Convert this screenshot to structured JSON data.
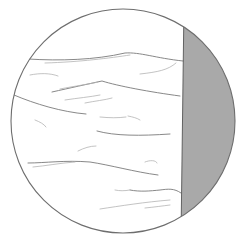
{
  "diagram": {
    "canvas": {
      "width": 242,
      "height": 240,
      "background": "#ffffff"
    },
    "circle": {
      "cx": 123,
      "cy": 121,
      "r": 112,
      "stroke": "#6e6e6e",
      "stroke_width": 1.1,
      "fill": "#ffffff"
    },
    "shaded_region": {
      "fill": "#a9a9a9",
      "boundary_line": {
        "x_top": 184,
        "y_top": 26,
        "x_bottom": 181,
        "y_bottom": 216,
        "stroke": "#555555"
      }
    },
    "line_color": "#7a7a7a",
    "light_line_color": "#b4b4b4",
    "strokes": [
      {
        "d": "M28,59 C60,61 95,60 125,53 C140,52 155,58 183,61",
        "strong": true
      },
      {
        "d": "M45,63 C80,62 110,58 130,55",
        "strong": false
      },
      {
        "d": "M140,74 C158,72 168,70 176,63",
        "strong": false
      },
      {
        "d": "M30,75 C40,73 50,73 58,76",
        "strong": false
      },
      {
        "d": "M52,92 C70,88 88,84 102,81 C118,86 150,92 180,96",
        "strong": true
      },
      {
        "d": "M60,89 C75,86 90,84 98,82",
        "strong": false
      },
      {
        "d": "M65,100 C78,98 90,97 100,95",
        "strong": false
      },
      {
        "d": "M85,103 C95,101 105,100 112,98",
        "strong": false
      },
      {
        "d": "M14,95 C35,104 62,112 86,114",
        "strong": true
      },
      {
        "d": "M100,117 C110,118 118,118 126,117",
        "strong": false
      },
      {
        "d": "M128,116 C133,117 137,118 140,120",
        "strong": false
      },
      {
        "d": "M35,120 C40,122 44,124 46,127",
        "strong": false
      },
      {
        "d": "M97,131 C115,136 140,136 170,134",
        "strong": true
      },
      {
        "d": "M78,151 C84,148 90,146 96,146",
        "strong": false
      },
      {
        "d": "M28,163 C45,163 65,160 90,162 C110,165 135,172 158,175",
        "strong": true
      },
      {
        "d": "M33,167 C45,166 60,163 75,162",
        "strong": false
      },
      {
        "d": "M145,162 C150,160 156,160 157,163",
        "strong": false
      },
      {
        "d": "M130,190 C140,192 150,191 160,190 C168,189 174,188 181,193",
        "strong": true
      },
      {
        "d": "M115,190 C120,191 124,191 130,190",
        "strong": false
      },
      {
        "d": "M100,209 C120,206 145,202 170,200",
        "strong": false
      },
      {
        "d": "M145,208 C155,207 162,206 170,205",
        "strong": false
      }
    ]
  }
}
